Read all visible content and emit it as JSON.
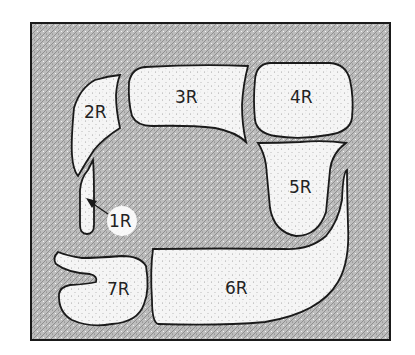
{
  "diagram": {
    "type": "anatomical-region-map",
    "colors": {
      "background": "#ffffff",
      "field_fill": "#b8b8b8",
      "region_fill": "#f4f4f4",
      "outline": "#1a1a1a",
      "label": "#222222"
    },
    "regions": [
      {
        "id": "1R",
        "label": "1R",
        "note": "narrow elongated region, indicated by arrow"
      },
      {
        "id": "2R",
        "label": "2R"
      },
      {
        "id": "3R",
        "label": "3R"
      },
      {
        "id": "4R",
        "label": "4R"
      },
      {
        "id": "5R",
        "label": "5R"
      },
      {
        "id": "6R",
        "label": "6R"
      },
      {
        "id": "7R",
        "label": "7R"
      }
    ]
  }
}
